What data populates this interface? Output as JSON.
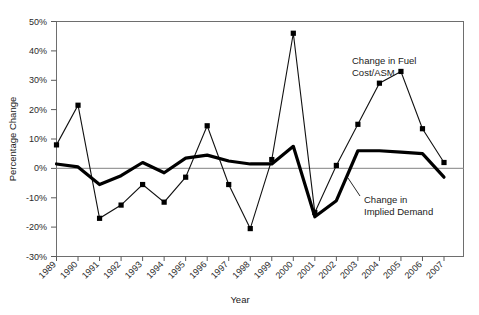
{
  "chart_data": {
    "type": "line",
    "title": "",
    "xlabel": "Year",
    "ylabel": "Percentage Change",
    "x": [
      1989,
      1990,
      1991,
      1992,
      1993,
      1994,
      1995,
      1996,
      1997,
      1998,
      1999,
      2000,
      2001,
      2002,
      2003,
      2004,
      2005,
      2006,
      2007
    ],
    "categories": [
      "1989",
      "1990",
      "1991",
      "1992",
      "1993",
      "1994",
      "1995",
      "1996",
      "1997",
      "1998",
      "1999",
      "2000",
      "2001",
      "2002",
      "2003",
      "2004",
      "2005",
      "2006",
      "2007"
    ],
    "ylim": [
      -30,
      50
    ],
    "ytick_labels": [
      "50%",
      "40%",
      "30%",
      "20%",
      "10%",
      "0%",
      "-10%",
      "-20%",
      "-30%"
    ],
    "ytick_values": [
      50,
      40,
      30,
      20,
      10,
      0,
      -10,
      -20,
      -30
    ],
    "grid": false,
    "legend_position": "inline-annotation",
    "series": [
      {
        "name": "Change in Fuel Cost/ASM",
        "marker": "square",
        "linewidth": "thin",
        "values": [
          8,
          21.5,
          -17,
          -12.5,
          -5.5,
          -11.5,
          -3,
          14.5,
          -5.5,
          -20.5,
          3,
          46,
          -15,
          1,
          15,
          29,
          33,
          13.5,
          2
        ]
      },
      {
        "name": "Change in Implied Demand",
        "marker": "none",
        "linewidth": "thick",
        "values": [
          1.5,
          0.5,
          -5.5,
          -2.5,
          2,
          -1.5,
          3.5,
          4.5,
          2.5,
          1.5,
          1.5,
          7.5,
          -16.5,
          -11,
          6,
          6,
          5.5,
          5,
          -3
        ]
      }
    ],
    "annotations": [
      {
        "name": "fuel-series-label",
        "text_line1": "Change in Fuel",
        "text_line2": "Cost/ASM"
      },
      {
        "name": "demand-series-label",
        "text_line1": "Change in",
        "text_line2": "Implied Demand"
      }
    ],
    "colors": {
      "fuel_line": "#111111",
      "demand_line": "#000000",
      "frame": "#6e6e6e",
      "zeroline": "#9a9a9a",
      "background": "#ffffff"
    }
  }
}
